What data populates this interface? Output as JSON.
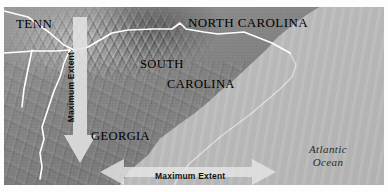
{
  "map": {
    "title": "Southeastern United States shaded relief map with maximum extent arrows",
    "labels": {
      "tennessee": "TENN",
      "north_carolina": "NORTH CAROLINA",
      "south_carolina_line1": "SOUTH",
      "south_carolina_line2": "CAROLINA",
      "georgia": "GEORGIA",
      "ocean_line1": "Atlantic",
      "ocean_line2": "Ocean"
    },
    "annotations": {
      "vertical_arrow_label": "Maximum Extent",
      "horizontal_arrow_label": "Maximum Extent"
    },
    "colors": {
      "land": "#8a8a8a",
      "ocean": "#bdbdbd",
      "border_line": "#ffffff",
      "arrow_fill": "#e3e3e3",
      "label_text": "#000000",
      "page_background": "#ffffff"
    },
    "icons": {
      "vertical_arrow": "arrow-down-icon",
      "horizontal_arrow": "arrow-left-right-icon"
    }
  }
}
